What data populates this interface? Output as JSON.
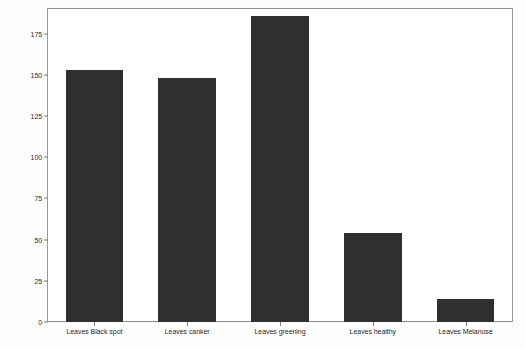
{
  "chart_data": {
    "type": "bar",
    "title": "",
    "xlabel": "",
    "ylabel": "",
    "categories": [
      "Leaves Black spot",
      "Leaves canker",
      "Leaves greening",
      "Leaves healthy",
      "Leaves Melanose"
    ],
    "values": [
      153,
      148,
      186,
      54,
      14
    ],
    "ylim": [
      0,
      190
    ],
    "yticks": [
      0,
      25,
      50,
      75,
      100,
      125,
      150,
      175
    ],
    "ytick_labels": [
      "0",
      "25",
      "50",
      "75",
      "100",
      "125",
      "150",
      "175"
    ],
    "grid": false,
    "legend": false,
    "bar_color": "#2f2f2f",
    "axis_color": "#8f8f8f",
    "background_color": "#ffffff"
  }
}
